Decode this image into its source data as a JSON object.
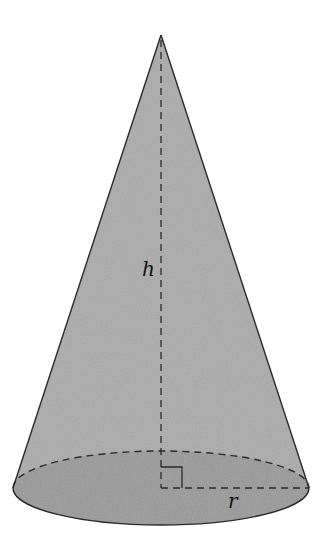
{
  "figure": {
    "labels": {
      "height": "h",
      "radius": "r"
    },
    "colors": {
      "background": "#ffffff",
      "lateral_surface": "#a9a9a9",
      "base_surface": "#999999",
      "stroke": "#2a2a2a"
    },
    "geometry": {
      "apex": [
        161,
        35
      ],
      "base_center": [
        161,
        488
      ],
      "base_rx": 148,
      "base_ry": 37,
      "right_angle_marker_size": 21
    }
  }
}
